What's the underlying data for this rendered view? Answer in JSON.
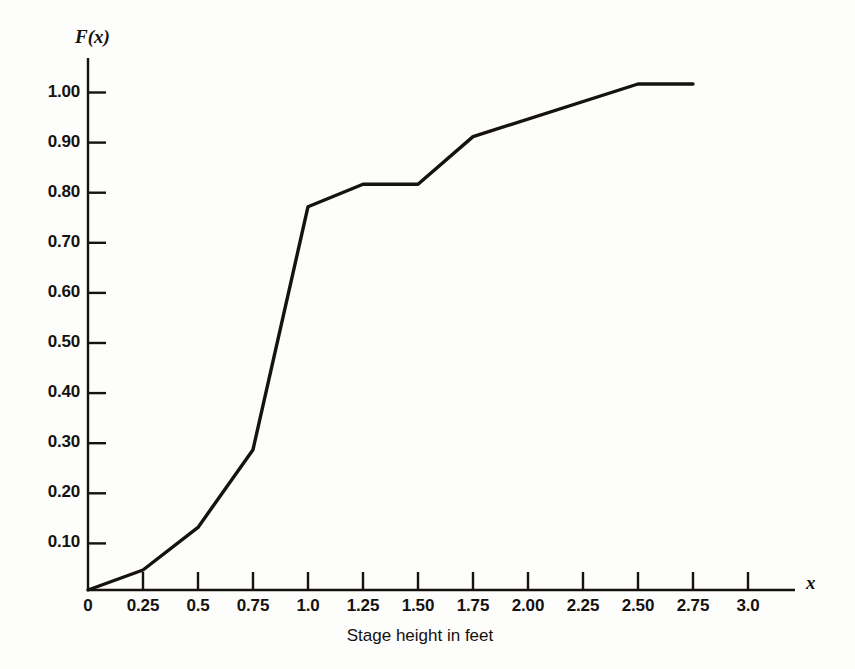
{
  "chart_data": {
    "type": "line",
    "title": "",
    "xlabel": "Stage height in feet",
    "ylabel": "F(x)",
    "x_axis_name": "x",
    "y_axis_name": "F(x)",
    "xlim": [
      0,
      3.25
    ],
    "ylim": [
      0,
      1.08
    ],
    "grid": false,
    "legend": null,
    "x_tick_labels": [
      "0",
      "0.25",
      "0.5",
      "0.75",
      "1.0",
      "1.25",
      "1.50",
      "1.75",
      "2.00",
      "2.25",
      "2.50",
      "2.75",
      "3.0"
    ],
    "x_tick_values": [
      0,
      0.25,
      0.5,
      0.75,
      1.0,
      1.25,
      1.5,
      1.75,
      2.0,
      2.25,
      2.5,
      2.75,
      3.0
    ],
    "y_tick_labels": [
      "0.10",
      "0.20",
      "0.30",
      "0.40",
      "0.50",
      "0.60",
      "0.70",
      "0.80",
      "0.90",
      "1.00"
    ],
    "y_tick_values": [
      0.1,
      0.2,
      0.3,
      0.4,
      0.5,
      0.6,
      0.7,
      0.8,
      0.9,
      1.0
    ],
    "series": [
      {
        "name": "Cumulative distribution F(x)",
        "color": "#15120f",
        "x": [
          0.0,
          0.25,
          0.5,
          0.75,
          1.0,
          1.25,
          1.5,
          1.75,
          2.5,
          2.75
        ],
        "values": [
          0.0,
          0.04,
          0.125,
          0.28,
          0.765,
          0.81,
          0.81,
          0.905,
          1.01,
          1.01
        ]
      }
    ]
  },
  "figure": {
    "caption": "Stage height in feet",
    "y_axis_title": "F(x)",
    "x_axis_title": "x"
  }
}
